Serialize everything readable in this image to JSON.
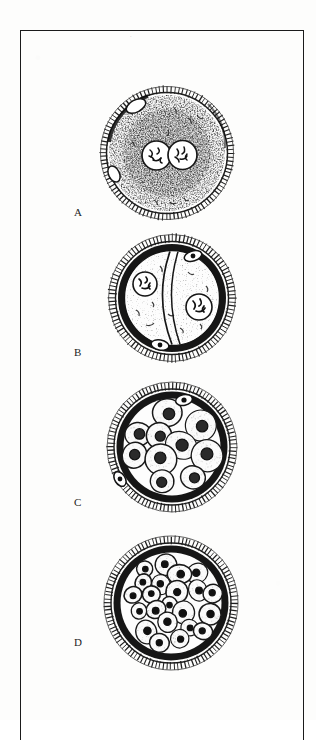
{
  "figure": {
    "kind": "scientific-illustration",
    "technique": "pen-and-ink stipple drawing (scanned)",
    "background_color": "#fdfdfc",
    "ink_color": "#1b1b1b",
    "frame": {
      "visible": true,
      "border_color": "#1b1b1b",
      "border_width_px": 1.4
    },
    "stray_mark": "·"
  },
  "stages": [
    {
      "id": "A",
      "label": "A",
      "title": "fertilized ovum with two pronuclei",
      "label_x_px": 74,
      "label_y_px": 212,
      "center_x_px": 167,
      "center_y_px": 153,
      "radius_px": 61,
      "cell_count": 1,
      "nucleus_count": 2,
      "polar_bodies": 2,
      "features": [
        "radial zona pellucida",
        "stippled cytoplasm",
        "paired pronuclei with chromatin",
        "polar bodies"
      ]
    },
    {
      "id": "B",
      "label": "B",
      "title": "two-cell stage",
      "label_x_px": 74,
      "label_y_px": 353,
      "center_x_px": 172,
      "center_y_px": 298,
      "radius_px": 63,
      "cell_count": 2,
      "nucleus_count": 2,
      "polar_bodies": 2,
      "features": [
        "radial zona pellucida",
        "dark perivitelline ring",
        "vertical cleavage furrow",
        "two blastomere nuclei"
      ]
    },
    {
      "id": "C",
      "label": "C",
      "title": "early morula",
      "label_x_px": 74,
      "label_y_px": 503,
      "center_x_px": 171,
      "center_y_px": 447,
      "radius_px": 65,
      "cell_count": 14,
      "nucleus_count": 14,
      "polar_bodies": 2,
      "features": [
        "radial zona pellucida",
        "dark perivitelline ring",
        "wedge-shaped blastomeres",
        "stippled cytoplasm"
      ]
    },
    {
      "id": "D",
      "label": "D",
      "title": "late morula",
      "label_x_px": 74,
      "label_y_px": 643,
      "center_x_px": 170,
      "center_y_px": 602,
      "radius_px": 67,
      "cell_count": 31,
      "nucleus_count": 31,
      "polar_bodies": 0,
      "features": [
        "radial zona pellucida",
        "dark perivitelline ring",
        "many small rounded blastomeres",
        "dark compact nuclei"
      ]
    }
  ]
}
